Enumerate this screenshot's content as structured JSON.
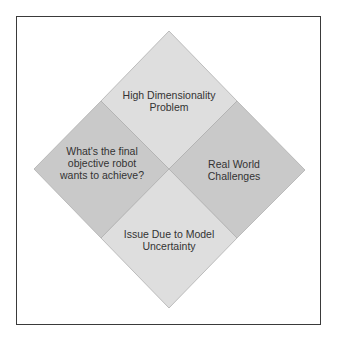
{
  "diagram": {
    "type": "quadrant-diamond",
    "quadrants": [
      {
        "id": "top",
        "lines": [
          "High Dimensionality",
          "Problem"
        ],
        "fill": "#dedede"
      },
      {
        "id": "left",
        "lines": [
          "What's the final",
          "objective robot",
          "wants to achieve?"
        ],
        "fill": "#c9c9c9"
      },
      {
        "id": "right",
        "lines": [
          "Real World",
          "Challenges"
        ],
        "fill": "#c9c9c9"
      },
      {
        "id": "bottom",
        "lines": [
          "Issue Due to Model",
          "Uncertainty"
        ],
        "fill": "#dedede"
      }
    ],
    "colors": {
      "frame_border": "#3a3a3a",
      "diamond_edge": "#b0b0b0",
      "text": "#333333",
      "background": "#ffffff"
    }
  }
}
